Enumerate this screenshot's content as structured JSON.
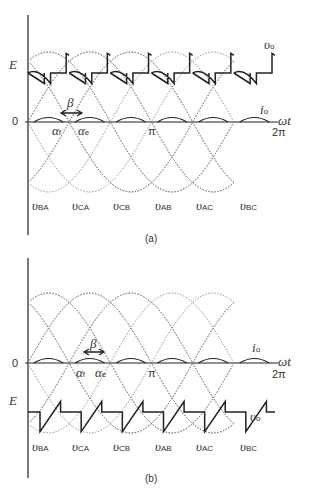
{
  "figure": {
    "panels": [
      {
        "id": "a",
        "caption": "(a)",
        "y_labels": {
          "E": "E",
          "zero": "0"
        },
        "x_labels": {
          "alpha_f": "α",
          "alpha_f_sub": "f",
          "alpha_e": "α",
          "alpha_e_sub": "e",
          "pi": "π",
          "two_pi": "2π",
          "omega_t": "ωt"
        },
        "beta": "β",
        "output_voltage": "υ",
        "output_voltage_sub": "o",
        "output_current": "i",
        "output_current_sub": "o",
        "phase_labels": [
          {
            "main": "υ",
            "sub": "BA"
          },
          {
            "main": "υ",
            "sub": "CA"
          },
          {
            "main": "υ",
            "sub": "CB"
          },
          {
            "main": "υ",
            "sub": "AB"
          },
          {
            "main": "υ",
            "sub": "AC"
          },
          {
            "main": "υ",
            "sub": "BC"
          }
        ]
      },
      {
        "id": "b",
        "caption": "(b)",
        "y_labels": {
          "E": "E",
          "zero": "0"
        },
        "x_labels": {
          "alpha_f": "α",
          "alpha_f_sub": "f",
          "alpha_e": "α",
          "alpha_e_sub": "e",
          "pi": "π",
          "two_pi": "2π",
          "omega_t": "ωt"
        },
        "beta": "β",
        "output_voltage": "υ",
        "output_voltage_sub": "o",
        "output_current": "i",
        "output_current_sub": "o",
        "phase_labels": [
          {
            "main": "υ",
            "sub": "BA"
          },
          {
            "main": "υ",
            "sub": "CA"
          },
          {
            "main": "υ",
            "sub": "CB"
          },
          {
            "main": "υ",
            "sub": "AB"
          },
          {
            "main": "υ",
            "sub": "AC"
          },
          {
            "main": "υ",
            "sub": "BC"
          }
        ]
      }
    ]
  },
  "colors": {
    "line": "#222222",
    "dotted": "#777777"
  }
}
